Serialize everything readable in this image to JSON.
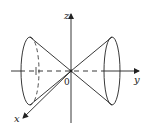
{
  "diagram": {
    "type": "double cone (nappes) along y-axis",
    "labels": {
      "z_axis": "z",
      "y_axis": "y",
      "x_axis": "x",
      "origin": "0"
    },
    "colors": {
      "stroke": "#222222",
      "background": "#ffffff"
    }
  }
}
